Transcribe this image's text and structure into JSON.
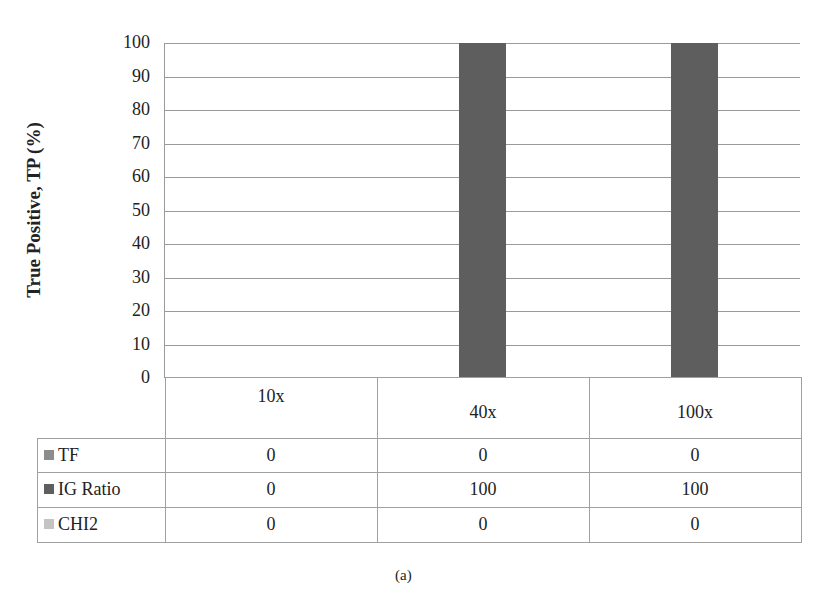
{
  "chart_data": {
    "type": "bar",
    "title": "",
    "xlabel": "",
    "ylabel": "True Positive, TP (%)",
    "ylim": [
      0,
      100
    ],
    "yticks": [
      "0",
      "10",
      "20",
      "30",
      "40",
      "50",
      "60",
      "70",
      "80",
      "90",
      "100"
    ],
    "grid": true,
    "legend_position": "data-table",
    "categories": [
      "10x",
      "40x",
      "100x"
    ],
    "series": [
      {
        "name": "TF",
        "color": "#8c8c8c",
        "values": [
          0,
          0,
          0
        ]
      },
      {
        "name": "IG Ratio",
        "color": "#5e5e5e",
        "values": [
          0,
          100,
          100
        ]
      },
      {
        "name": "CHI2",
        "color": "#c4c4c4",
        "values": [
          0,
          0,
          0
        ]
      }
    ],
    "caption": "(a)"
  },
  "table": {
    "rows": [
      {
        "label": "TF",
        "values": [
          "0",
          "0",
          "0"
        ]
      },
      {
        "label": "IG Ratio",
        "values": [
          "0",
          "100",
          "100"
        ]
      },
      {
        "label": "CHI2",
        "values": [
          "0",
          "0",
          "0"
        ]
      }
    ]
  }
}
